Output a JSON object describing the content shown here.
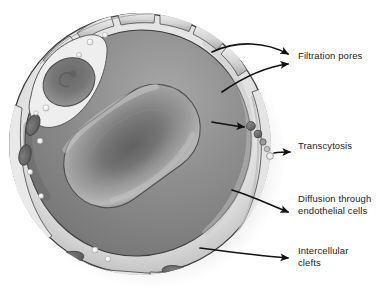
{
  "figure": {
    "style": "grayscale anatomical illustration",
    "background_color": "#ffffff",
    "text_color": "#1b1b1b"
  },
  "labels": [
    {
      "id": "filtration",
      "text": "Filtration pores",
      "x": 298,
      "y": 50,
      "lines": 1,
      "arrow_count": 2
    },
    {
      "id": "transcytosis",
      "text": "Transcytosis",
      "x": 298,
      "y": 140,
      "lines": 1,
      "arrow_count": 1
    },
    {
      "id": "diffusion",
      "text": "Diffusion through\nendothelial cells",
      "x": 298,
      "y": 193,
      "lines": 2,
      "arrow_count": 1
    },
    {
      "id": "clefts",
      "text": "Intercellular\nclefts",
      "x": 298,
      "y": 245,
      "lines": 2,
      "arrow_count": 1
    }
  ],
  "structures": {
    "capillary_lumen": {
      "name": "capillary lumen",
      "fill": "#8c8c8c"
    },
    "endothelial_wall": {
      "name": "endothelial cell wall",
      "fill": "#d9d9d9"
    },
    "red_blood_cell": {
      "name": "erythrocyte",
      "fill": "#949494",
      "shape": "biconcave disc",
      "rotation_deg": -36
    },
    "endothelial_nucleus": {
      "name": "endothelial cell nucleus",
      "fill": "#7e7e7e"
    },
    "filtration_pore_plates": {
      "name": "filtration pore plates",
      "count": 6,
      "fill": "#cfcfcf"
    },
    "transcytosis_vesicles": {
      "name": "transcytotic vesicles",
      "count": 5,
      "fill": "#6e6e6e"
    },
    "organelles": {
      "name": "wall organelles",
      "count": 4,
      "fill": "#6b6b6b"
    },
    "wall_vesicles": {
      "name": "small wall vesicles",
      "count": 12,
      "fill": "#ededed"
    },
    "intercellular_clefts": {
      "name": "intercellular clefts",
      "count": 3
    }
  },
  "colors": {
    "outline": "#2b2b2b",
    "arrow": "#111111",
    "lumen_dark": "#6f6f6f",
    "lumen_mid": "#8c8c8c",
    "lumen_light": "#b4b4b4",
    "wall_light": "#e6e6e6",
    "wall_mid": "#cccccc",
    "wall_shadow": "#9a9a9a",
    "rbc_dark": "#6d6d6d",
    "rbc_mid": "#8f8f8f",
    "rbc_light": "#bdbdbd"
  }
}
